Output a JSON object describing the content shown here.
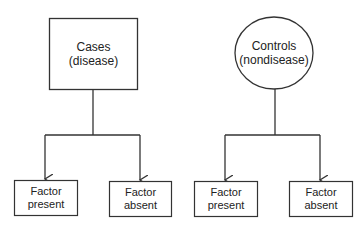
{
  "diagram": {
    "type": "case-control study design",
    "stroke_color": "#333333",
    "nodes": {
      "cases": {
        "shape": "rectangle",
        "line1": "Cases",
        "line2": "(disease)"
      },
      "controls": {
        "shape": "circle",
        "line1": "Controls",
        "line2": "(nondisease)"
      },
      "cases_factor_present": {
        "shape": "rectangle",
        "line1": "Factor",
        "line2": "present"
      },
      "cases_factor_absent": {
        "shape": "rectangle",
        "line1": "Factor",
        "line2": "absent"
      },
      "controls_factor_present": {
        "shape": "rectangle",
        "line1": "Factor",
        "line2": "present"
      },
      "controls_factor_absent": {
        "shape": "rectangle",
        "line1": "Factor",
        "line2": "absent"
      }
    },
    "edges": [
      {
        "from": "cases",
        "to": "cases_factor_present"
      },
      {
        "from": "cases",
        "to": "cases_factor_absent"
      },
      {
        "from": "controls",
        "to": "controls_factor_present"
      },
      {
        "from": "controls",
        "to": "controls_factor_absent"
      }
    ]
  }
}
